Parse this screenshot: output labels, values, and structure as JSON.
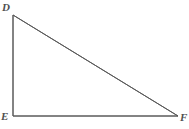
{
  "figure": {
    "kind": "geometry-diagram",
    "shape": "right-triangle",
    "background_color": "#ffffff",
    "stroke_color": "#5a5a5a",
    "stroke_width": 1,
    "width": 189,
    "height": 129,
    "label_color": "#4f4f4f",
    "right_angle_vertex": "E"
  },
  "labels": {
    "D": "D",
    "E": "E",
    "F": "F"
  },
  "chart_data": {
    "type": "scatter",
    "title": "",
    "xlabel": "",
    "ylabel": "",
    "vertices": [
      {
        "name": "D",
        "x": 13,
        "y": 15
      },
      {
        "name": "E",
        "x": 13,
        "y": 116
      },
      {
        "name": "F",
        "x": 178,
        "y": 116
      }
    ],
    "edges": [
      {
        "name": "DE",
        "from": "D",
        "to": "E"
      },
      {
        "name": "EF",
        "from": "E",
        "to": "F"
      },
      {
        "name": "DF",
        "from": "D",
        "to": "F"
      }
    ],
    "xlim": [
      0,
      189
    ],
    "ylim": [
      0,
      129
    ],
    "grid": false,
    "legend": "none"
  }
}
